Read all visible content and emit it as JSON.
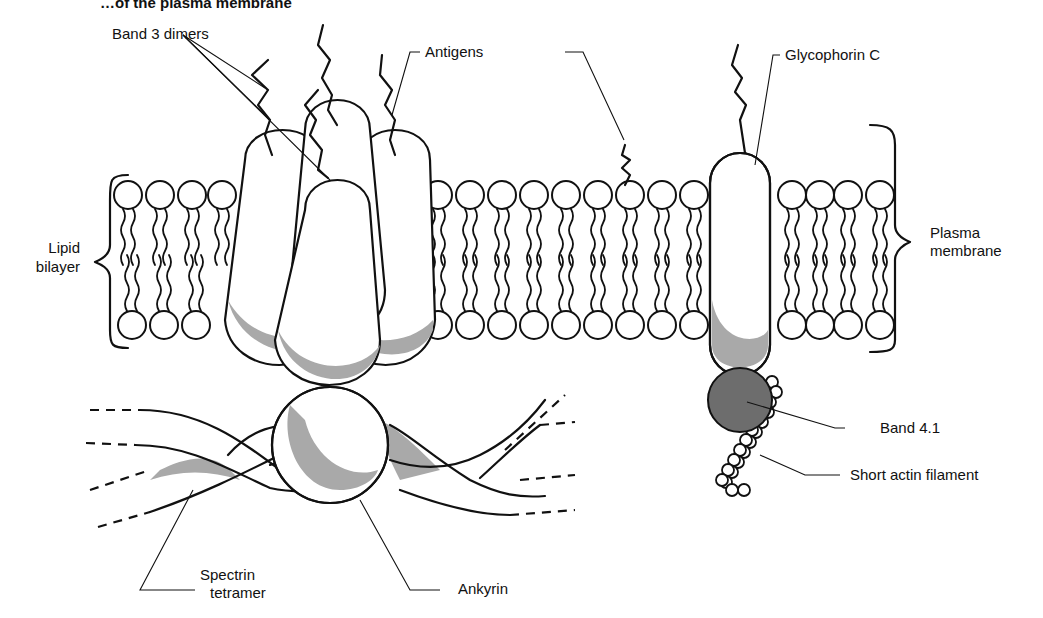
{
  "figure": {
    "title": "…of the plasma membrane",
    "labels": {
      "band3": "Band 3 dimers",
      "antigens": "Antigens",
      "glycophorin": "Glycophorin C",
      "lipid_line1": "Lipid",
      "lipid_line2": "bilayer",
      "plasma_line1": "Plasma",
      "plasma_line2": "membrane",
      "band41": "Band 4.1",
      "actin": "Short actin filament",
      "spectrin_line1": "Spectrin",
      "spectrin_line2": "tetramer",
      "ankyrin": "Ankyrin"
    },
    "colors": {
      "shading": "#a9a9a9",
      "band41_fill": "#6d6d6d",
      "ink": "#111111"
    }
  }
}
